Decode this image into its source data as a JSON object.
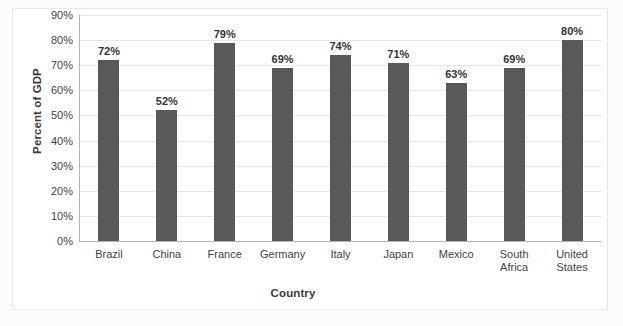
{
  "chart_data": {
    "type": "bar",
    "title": "",
    "xlabel": "Country",
    "ylabel": "Percent of GDP",
    "categories": [
      "Brazil",
      "China",
      "France",
      "Germany",
      "Italy",
      "Japan",
      "Mexico",
      "South Africa",
      "United States"
    ],
    "values": [
      72,
      52,
      79,
      69,
      74,
      71,
      63,
      69,
      80
    ],
    "value_labels": [
      "72%",
      "52%",
      "79%",
      "69%",
      "74%",
      "71%",
      "63%",
      "69%",
      "80%"
    ],
    "ylim": [
      0,
      90
    ],
    "ytick_values": [
      0,
      10,
      20,
      30,
      40,
      50,
      60,
      70,
      80,
      90
    ],
    "ytick_labels": [
      "0%",
      "10%",
      "20%",
      "30%",
      "40%",
      "50%",
      "60%",
      "70%",
      "80%",
      "90%"
    ],
    "grid": true,
    "legend": null,
    "legend_position": "none",
    "series_color": "#595959",
    "gridline_color": "#e6e6e6",
    "axis_color": "#b5b5b5",
    "plot_background": "#ffffff",
    "frame_border_color": "#e8e8e8"
  }
}
